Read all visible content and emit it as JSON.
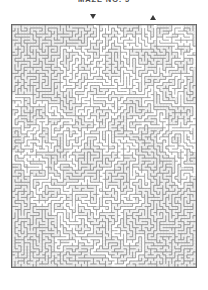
{
  "page": {
    "title": "MAZE NO. 5",
    "background_color": "#ffffff"
  },
  "markers": [
    {
      "name": "entrance",
      "glyph": "down-triangle",
      "x": 93,
      "y": 16,
      "color": "#3b3b3b"
    },
    {
      "name": "exit",
      "glyph": "up-triangle",
      "x": 153,
      "y": 16,
      "color": "#3b3b3b"
    }
  ],
  "maze": {
    "x": 11,
    "y": 24,
    "width": 186,
    "height": 244,
    "cols": 61,
    "rows": 80,
    "cell_size": 3,
    "entrance_col": 27,
    "exit_col": 47,
    "colors": {
      "wall": "#8e8e8e",
      "fill": "#c2c2c2",
      "corridor": "#f2f2f2",
      "solution": "#ffffff",
      "border": "#6d6d6d"
    },
    "seed": 20250514
  }
}
